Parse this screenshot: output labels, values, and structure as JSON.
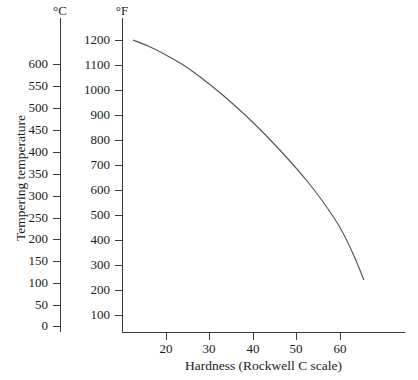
{
  "axes": {
    "left_unit_label": "°C",
    "right_unit_label": "°F",
    "y_title": "Tempering temperature",
    "x_title": "Hardness (Rockwell C scale)"
  },
  "chart_data": {
    "type": "line",
    "title": "",
    "xlabel": "Hardness (Rockwell C scale)",
    "ylabel": "Tempering temperature",
    "y_unit_primary": "°C",
    "y_unit_secondary": "°F",
    "grid": false,
    "legend": "none",
    "xlim": [
      12,
      68
    ],
    "xticks": [
      20,
      30,
      40,
      50,
      60
    ],
    "xticklabels": [
      "20",
      "30",
      "40",
      "50",
      "60"
    ],
    "ylim_celsius": [
      0,
      620
    ],
    "yticks_celsius": [
      0,
      50,
      100,
      150,
      200,
      250,
      300,
      350,
      400,
      450,
      500,
      550,
      600
    ],
    "yticklabels_celsius": [
      "0",
      "50",
      "100",
      "150",
      "200",
      "250",
      "300",
      "350",
      "400",
      "450",
      "500",
      "550",
      "600"
    ],
    "ylim_fahrenheit": [
      60,
      1250
    ],
    "yticks_fahrenheit": [
      100,
      200,
      300,
      400,
      500,
      600,
      700,
      800,
      900,
      1000,
      1100,
      1200
    ],
    "yticklabels_fahrenheit": [
      "100",
      "200",
      "300",
      "400",
      "500",
      "600",
      "700",
      "800",
      "900",
      "1000",
      "1100",
      "1200"
    ],
    "series": [
      {
        "name": "Tempering temperature vs hardness",
        "x": [
          12.4,
          16.0,
          20.0,
          24.0,
          28.0,
          32.0,
          36.0,
          40.0,
          44.0,
          48.0,
          52.0,
          56.0,
          60.0,
          63.0,
          65.5
        ],
        "y_fahrenheit": [
          1200,
          1175,
          1140,
          1100,
          1050,
          995,
          935,
          870,
          800,
          725,
          645,
          555,
          450,
          345,
          240
        ],
        "y_celsius": [
          649,
          635,
          616,
          593,
          566,
          535,
          502,
          466,
          427,
          385,
          341,
          291,
          232,
          174,
          116
        ]
      }
    ]
  },
  "ticks": {
    "celsius": [
      {
        "label": "600",
        "top": 64
      },
      {
        "label": "550",
        "top": 86
      },
      {
        "label": "500",
        "top": 108
      },
      {
        "label": "450",
        "top": 130
      },
      {
        "label": "400",
        "top": 152
      },
      {
        "label": "350",
        "top": 174
      },
      {
        "label": "300",
        "top": 196
      },
      {
        "label": "250",
        "top": 218
      },
      {
        "label": "200",
        "top": 239
      },
      {
        "label": "150",
        "top": 261
      },
      {
        "label": "100",
        "top": 283
      },
      {
        "label": "50",
        "top": 305
      },
      {
        "label": "0",
        "top": 326
      }
    ],
    "fahrenheit": [
      {
        "label": "1200",
        "top": 40
      },
      {
        "label": "1100",
        "top": 65
      },
      {
        "label": "1000",
        "top": 90
      },
      {
        "label": "900",
        "top": 115
      },
      {
        "label": "800",
        "top": 140
      },
      {
        "label": "700",
        "top": 165
      },
      {
        "label": "600",
        "top": 190
      },
      {
        "label": "500",
        "top": 215
      },
      {
        "label": "400",
        "top": 240
      },
      {
        "label": "300",
        "top": 265
      },
      {
        "label": "200",
        "top": 290
      },
      {
        "label": "100",
        "top": 315
      }
    ],
    "hardness": [
      {
        "label": "20",
        "left": 166
      },
      {
        "label": "30",
        "left": 209
      },
      {
        "label": "40",
        "left": 253
      },
      {
        "label": "50",
        "left": 296
      },
      {
        "label": "60",
        "left": 340
      }
    ]
  },
  "style": {
    "curve_color": "#55555a",
    "axis_color": "#3a3a3a",
    "background": "#ffffff",
    "text_color": "#1a1a1a"
  }
}
